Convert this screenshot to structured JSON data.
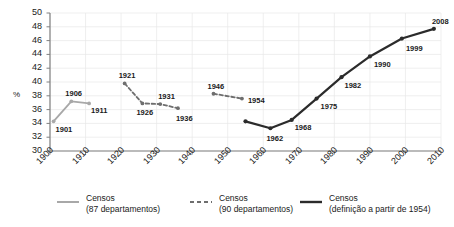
{
  "chart_data": {
    "type": "line",
    "title": "",
    "xlabel": "",
    "ylabel": "%",
    "xlim": [
      1900,
      2010
    ],
    "ylim": [
      30,
      50
    ],
    "yticks": [
      30,
      32,
      34,
      36,
      38,
      40,
      42,
      44,
      46,
      48,
      50
    ],
    "xticks": [
      1900,
      1910,
      1920,
      1930,
      1940,
      1950,
      1960,
      1970,
      1980,
      1990,
      2000,
      2010
    ],
    "grid": true,
    "legend_position": "bottom",
    "series": [
      {
        "name": "censos-87",
        "legend_line1": "Censos",
        "legend_line2": "(87 departamentos)",
        "color": "#a8a8a8",
        "style": "solid",
        "x": [
          1901,
          1906,
          1911
        ],
        "y": [
          34.3,
          37.2,
          36.9
        ],
        "labels": [
          "1901",
          "1906",
          "1911"
        ]
      },
      {
        "name": "censos-90",
        "legend_line1": "Censos",
        "legend_line2": "(90 departamentos)",
        "color": "#6e6e6e",
        "style": "dashed",
        "x": [
          1921,
          1926,
          1931,
          1936,
          1946,
          1954
        ],
        "y": [
          39.8,
          36.9,
          36.8,
          36.2,
          38.3,
          37.6
        ],
        "labels": [
          "1921",
          "1926",
          "1931",
          "1936",
          "1946",
          "1954"
        ],
        "breaks": [
          3
        ]
      },
      {
        "name": "censos-1954",
        "legend_line1": "Censos",
        "legend_line2": "(definição a partir de 1954)",
        "color": "#2b2b2b",
        "style": "solid",
        "x": [
          1955,
          1962,
          1968,
          1975,
          1982,
          1990,
          1999,
          2008
        ],
        "y": [
          34.3,
          33.3,
          34.5,
          37.6,
          40.7,
          43.7,
          46.3,
          47.7
        ],
        "labels": [
          "",
          "1962",
          "1968",
          "1975",
          "1982",
          "1990",
          "1999",
          "2008"
        ]
      }
    ]
  },
  "axis": {
    "y_unit": "%"
  }
}
